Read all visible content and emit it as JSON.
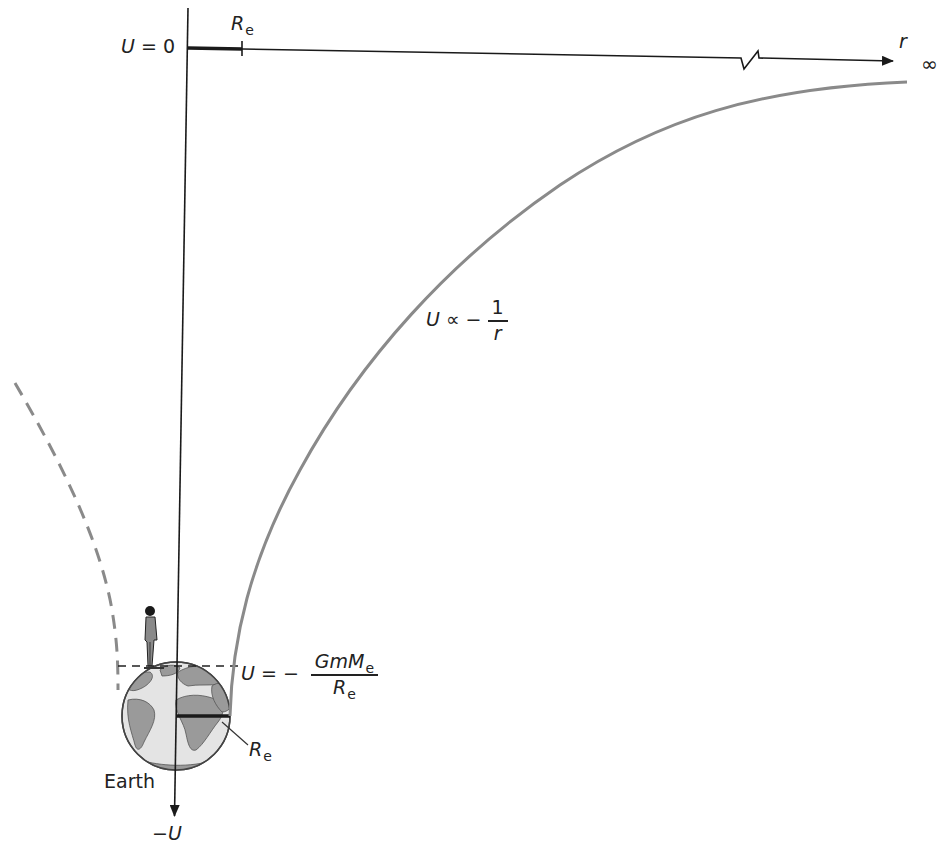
{
  "diagram": {
    "type": "gravitational-potential-energy-graph",
    "colors": {
      "axis": "#1a1a1a",
      "curve": "#8a8a8a",
      "dashed_curve": "#8a8a8a",
      "earth_ocean": "#e4e4e4",
      "earth_land": "#9a9a9a",
      "earth_outline": "#444444"
    },
    "labels": {
      "u_zero": "U = 0",
      "r_axis": "r",
      "infinity": "∞",
      "neg_u_axis": "−U",
      "re_top": {
        "symbol": "R",
        "subscript": "e"
      },
      "curve_label": {
        "lhs": "U ∝ −",
        "num": "1",
        "den": "r"
      },
      "surface_label": {
        "lhs": "U = −",
        "num_main": "GmM",
        "num_sub": "e",
        "den_main": "R",
        "den_sub": "e"
      },
      "re_radius": {
        "symbol": "R",
        "subscript": "e"
      },
      "earth": "Earth"
    }
  }
}
